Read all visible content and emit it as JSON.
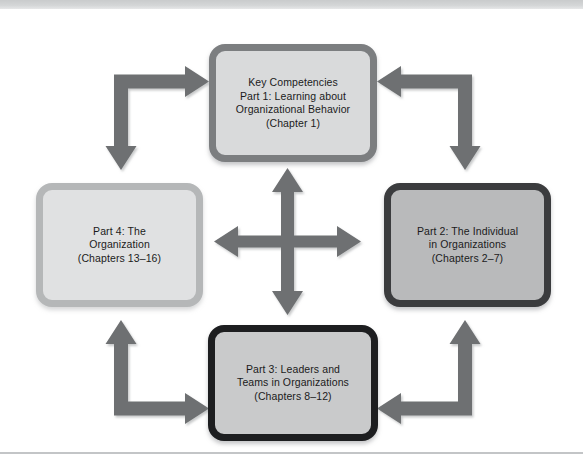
{
  "figure": {
    "type": "cycle-diagram",
    "arrow_color": "#6e7072",
    "background_color": "#ffffff",
    "node_count": 4
  },
  "nodes": [
    {
      "id": "node-top",
      "name": "part-1-box",
      "lines": [
        "Key Competencies",
        "Part 1: Learning about",
        "Organizational Behavior",
        "(Chapter 1)"
      ],
      "border_color": "#7c7e80",
      "fill_color": "#d9dadb"
    },
    {
      "id": "node-right",
      "name": "part-2-box",
      "lines": [
        "Part 2: The Individual",
        "in Organizations",
        "(Chapters 2–7)"
      ],
      "border_color": "#3b3c3e",
      "fill_color": "#b9babb"
    },
    {
      "id": "node-bottom",
      "name": "part-3-box",
      "lines": [
        "Part 3: Leaders and",
        "Teams in Organizations",
        "(Chapters 8–12)"
      ],
      "border_color": "#1d1e20",
      "fill_color": "#c9cacb"
    },
    {
      "id": "node-left",
      "name": "part-4-box",
      "lines": [
        "Part 4: The",
        "Organization",
        "(Chapters 13–16)"
      ],
      "border_color": "#b5b7b8",
      "fill_color": "#e0e1e2"
    }
  ],
  "text": {
    "top": "Key Competencies\nPart 1: Learning about\nOrganizational Behavior\n(Chapter 1)",
    "right": "Part 2: The Individual\nin Organizations\n(Chapters 2–7)",
    "bottom": "Part 3: Leaders and\nTeams in Organizations\n(Chapters 8–12)",
    "left": "Part 4: The\nOrganization\n(Chapters 13–16)"
  },
  "connectors": [
    {
      "name": "center-cross-arrow",
      "kind": "four-way-double-arrow",
      "links": [
        "top",
        "right",
        "bottom",
        "left"
      ]
    },
    {
      "name": "elbow-top-left",
      "kind": "double-headed-elbow",
      "from": "part-4-box",
      "to": "part-1-box"
    },
    {
      "name": "elbow-top-right",
      "kind": "double-headed-elbow",
      "from": "part-2-box",
      "to": "part-1-box"
    },
    {
      "name": "elbow-bottom-left",
      "kind": "double-headed-elbow",
      "from": "part-3-box",
      "to": "part-4-box"
    },
    {
      "name": "elbow-bottom-right",
      "kind": "double-headed-elbow",
      "from": "part-3-box",
      "to": "part-2-box"
    }
  ]
}
